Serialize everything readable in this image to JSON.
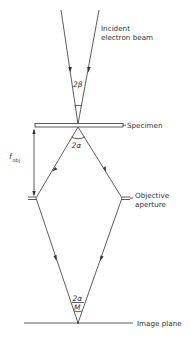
{
  "labels": {
    "incident_beam_line1": "Incident",
    "incident_beam_line2": "electron beam",
    "specimen": "Specimen",
    "objective_aperture_line1": "Objective",
    "objective_aperture_line2": "aperture",
    "image_plane": "Image plane",
    "focal_length_symbol": "f",
    "focal_length_subscript": "obj"
  },
  "angles": {
    "incident_convergence": "2β",
    "objective_collection": "2α",
    "image_numerator": "2α",
    "image_denominator": "M"
  },
  "colors": {
    "line": "#333333",
    "background": "#ffffff"
  }
}
